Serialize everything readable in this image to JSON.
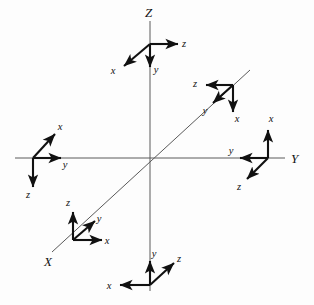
{
  "figure": {
    "background_color": "#fdfdfd",
    "axis_color": "#5a5a5a",
    "arrow_color": "#111111"
  },
  "global_axes": [
    {
      "id": "axis-X",
      "label": "X",
      "label_x": 44,
      "label_y": 266,
      "x1": 250,
      "y1": 70,
      "x2": 52,
      "y2": 252
    },
    {
      "id": "axis-Y",
      "label": "Y",
      "label_x": 291,
      "label_y": 163,
      "x1": 15,
      "y1": 158,
      "x2": 285,
      "y2": 158
    },
    {
      "id": "axis-Z",
      "label": "Z",
      "label_x": 145,
      "label_y": 17,
      "x1": 150,
      "y1": 21,
      "x2": 150,
      "y2": 291
    }
  ],
  "frames": [
    {
      "id": "frame-top",
      "name": "top-frame-on-z-axis",
      "origin_x": 150,
      "origin_y": 44,
      "arrows": [
        {
          "axis": "z",
          "dx": 28,
          "dy": 0,
          "label_dx": 6,
          "label_dy": 3
        },
        {
          "axis": "x",
          "dx": -26,
          "dy": 22,
          "label_dx": -11,
          "label_dy": 8
        },
        {
          "axis": "y",
          "dx": 0,
          "dy": 23,
          "label_dx": 6,
          "label_dy": 6
        }
      ]
    },
    {
      "id": "frame-upper-right",
      "name": "upper-right-frame-on-x-axis",
      "origin_x": 233,
      "origin_y": 85,
      "arrows": [
        {
          "axis": "z",
          "dx": -27,
          "dy": 0,
          "label_dx": -11,
          "label_dy": 2
        },
        {
          "axis": "x",
          "dx": 0,
          "dy": 27,
          "label_dx": 4,
          "label_dy": 10
        },
        {
          "axis": "y",
          "dx": -20,
          "dy": 18,
          "label_dx": -8,
          "label_dy": 11
        }
      ]
    },
    {
      "id": "frame-right",
      "name": "right-frame-on-y-axis",
      "origin_x": 268,
      "origin_y": 158,
      "arrows": [
        {
          "axis": "x",
          "dx": 0,
          "dy": -28,
          "label_dx": 3,
          "label_dy": -8
        },
        {
          "axis": "y",
          "dx": -28,
          "dy": 0,
          "label_dx": -9,
          "label_dy": -4
        },
        {
          "axis": "z",
          "dx": -21,
          "dy": 21,
          "label_dx": -8,
          "label_dy": 11
        }
      ]
    },
    {
      "id": "frame-left",
      "name": "left-frame-on-y-axis",
      "origin_x": 33,
      "origin_y": 158,
      "arrows": [
        {
          "axis": "x",
          "dx": 22,
          "dy": -24,
          "label_dx": 5,
          "label_dy": -4
        },
        {
          "axis": "y",
          "dx": 28,
          "dy": 0,
          "label_dx": 4,
          "label_dy": 10
        },
        {
          "axis": "z",
          "dx": 0,
          "dy": 29,
          "label_dx": -5,
          "label_dy": 11
        }
      ]
    },
    {
      "id": "frame-lower-left",
      "name": "lower-left-frame-on-x-axis",
      "origin_x": 73,
      "origin_y": 240,
      "arrows": [
        {
          "axis": "z",
          "dx": 0,
          "dy": -28,
          "label_dx": -5,
          "label_dy": -6
        },
        {
          "axis": "x",
          "dx": 29,
          "dy": 0,
          "label_dx": 5,
          "label_dy": 4
        },
        {
          "axis": "y",
          "dx": 22,
          "dy": -19,
          "label_dx": 4,
          "label_dy": 1
        }
      ]
    },
    {
      "id": "frame-bottom",
      "name": "bottom-frame-on-z-axis",
      "origin_x": 150,
      "origin_y": 285,
      "arrows": [
        {
          "axis": "x",
          "dx": -30,
          "dy": 0,
          "label_dx": -11,
          "label_dy": 4
        },
        {
          "axis": "y",
          "dx": 0,
          "dy": -24,
          "label_dx": 4,
          "label_dy": -4
        },
        {
          "axis": "z",
          "dx": 24,
          "dy": -22,
          "label_dx": 5,
          "label_dy": -1
        }
      ]
    }
  ]
}
